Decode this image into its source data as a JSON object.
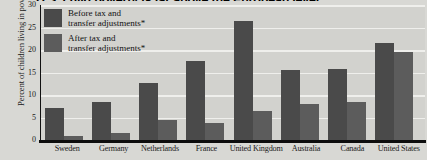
{
  "chart_data": {
    "type": "bar",
    "title": "U.S. child poverty is far above the European level",
    "xlabel": "",
    "ylabel": "Percent of children living in poverty",
    "ylim": [
      0,
      30
    ],
    "yticks": [
      30,
      25,
      20,
      15,
      10,
      5,
      0
    ],
    "grid": true,
    "legend_position": "top-left",
    "categories": [
      "Sweden",
      "Germany",
      "Netherlands",
      "France",
      "United Kingdom",
      "Australia",
      "Canada",
      "United States"
    ],
    "series": [
      {
        "name": "Before tax and transfer adjustments*",
        "color": "#4a4a4a",
        "values": [
          7.4,
          8.7,
          12.8,
          17.7,
          26.7,
          15.7,
          16.1,
          21.8
        ]
      },
      {
        "name": "After tax and transfer adjustments*",
        "color": "#5c5c5c",
        "values": [
          1.1,
          1.8,
          4.7,
          4.0,
          6.7,
          8.3,
          8.7,
          19.8
        ]
      }
    ]
  },
  "legend": {
    "items": [
      {
        "line1": "Before tax and",
        "line2": "transfer adjustments*",
        "swatch": "before"
      },
      {
        "line1": "After tax and",
        "line2": "transfer adjustments*",
        "swatch": "after"
      }
    ]
  }
}
